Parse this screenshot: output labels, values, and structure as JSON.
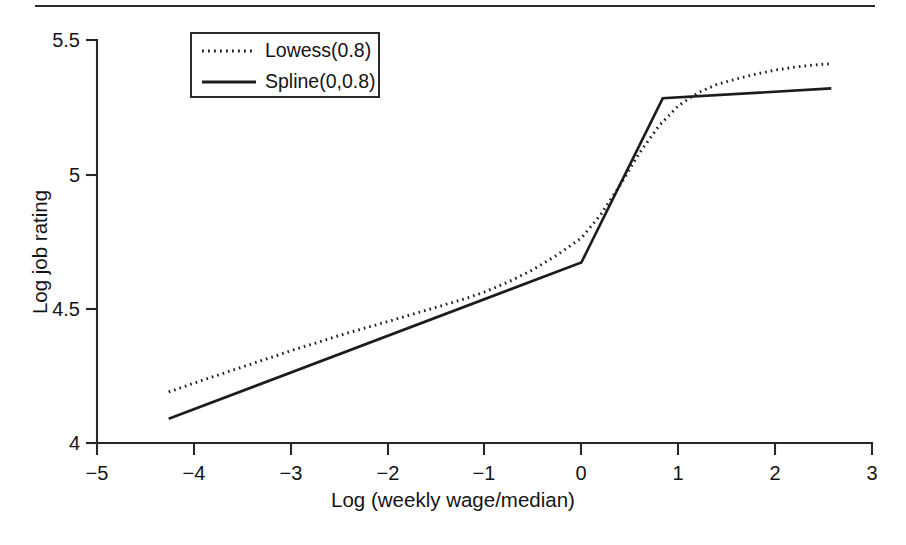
{
  "figure": {
    "top_rule": true,
    "background": "#ffffff",
    "ink_color": "#1c1c1c"
  },
  "chart_data": {
    "type": "line",
    "title": "",
    "xlabel": "Log (weekly wage/median)",
    "ylabel": "Log job rating",
    "xlim": [
      -5,
      3
    ],
    "ylim": [
      4,
      5.5
    ],
    "xticks": [
      -5,
      -4,
      -3,
      -2,
      -1,
      0,
      1,
      2,
      3
    ],
    "xticklabels": [
      "−5",
      "−4",
      "−3",
      "−2",
      "−1",
      "0",
      "1",
      "2",
      "3"
    ],
    "yticks": [
      4,
      4.5,
      5,
      5.5
    ],
    "yticklabels": [
      "4",
      "4.5",
      "5",
      "5.5"
    ],
    "grid": false,
    "legend_position": "upper left",
    "series": [
      {
        "name": "Lowess(0.8)",
        "style": "dotted",
        "color": "#1c1c1c",
        "x": [
          -4.26,
          -3.9,
          -3.5,
          -3.0,
          -2.5,
          -2.0,
          -1.5,
          -1.2,
          -1.0,
          -0.75,
          -0.5,
          -0.25,
          0.0,
          0.2,
          0.4,
          0.6,
          0.8,
          1.0,
          1.2,
          1.4,
          1.6,
          1.8,
          2.0,
          2.2,
          2.4,
          2.58
        ],
        "y": [
          4.19,
          4.235,
          4.283,
          4.343,
          4.4,
          4.452,
          4.505,
          4.537,
          4.562,
          4.6,
          4.645,
          4.7,
          4.763,
          4.85,
          4.96,
          5.08,
          5.18,
          5.255,
          5.303,
          5.335,
          5.355,
          5.373,
          5.388,
          5.399,
          5.407,
          5.412
        ]
      },
      {
        "name": "Spline(0,0.8)",
        "style": "solid",
        "color": "#1c1c1c",
        "x": [
          -4.26,
          0.0,
          0.84,
          2.58
        ],
        "y": [
          4.09,
          4.672,
          5.283,
          5.32
        ],
        "knots": [
          0,
          0.8
        ]
      }
    ]
  },
  "legend": {
    "items": [
      {
        "label": "Lowess(0.8)",
        "style": "dotted"
      },
      {
        "label": "Spline(0,0.8)",
        "style": "solid"
      }
    ]
  }
}
